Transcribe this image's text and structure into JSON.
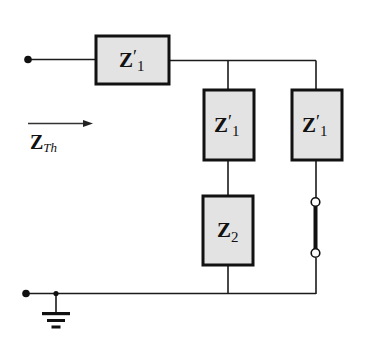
{
  "diagram": {
    "type": "circuit",
    "colors": {
      "wire": "#1a1a1a",
      "box_fill": "#e3e3e3",
      "box_stroke": "#111111",
      "background": "#ffffff"
    },
    "thevenin_label": {
      "main": "Z",
      "sub": "Th"
    },
    "components": [
      {
        "id": "series",
        "main": "Z",
        "prime": "′",
        "sub": "1"
      },
      {
        "id": "branch-middle-top",
        "main": "Z",
        "prime": "′",
        "sub": "1"
      },
      {
        "id": "branch-middle-bottom",
        "main": "Z",
        "prime": "",
        "sub": "2"
      },
      {
        "id": "branch-right",
        "main": "Z",
        "prime": "′",
        "sub": "1"
      }
    ],
    "short_circuit": "short between terminals in right branch",
    "ground": "ground symbol on bottom rail"
  }
}
